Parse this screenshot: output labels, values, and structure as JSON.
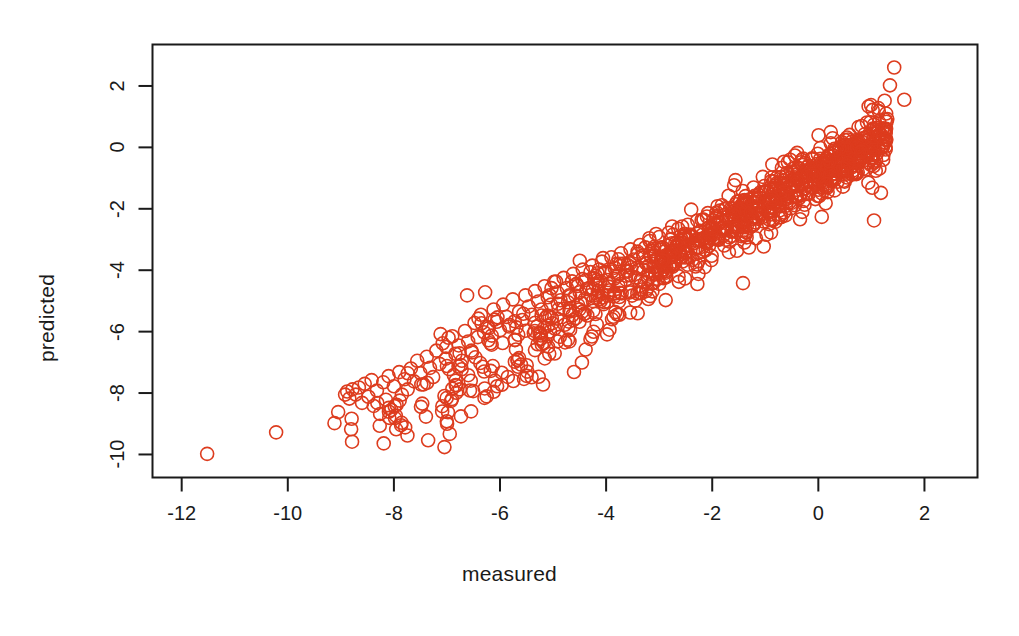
{
  "figure": {
    "background_color": "#ffffff",
    "point_color": "#dd3c1e",
    "axis_color": "#1a1a1a"
  },
  "chart_data": {
    "type": "scatter",
    "title": "",
    "subtitle": "",
    "xlabel": "measured",
    "ylabel": "predicted",
    "xlim": [
      -12.55,
      3.0
    ],
    "ylim": [
      -10.75,
      3.35
    ],
    "xticks": [
      -12,
      -10,
      -8,
      -6,
      -4,
      -2,
      0,
      2
    ],
    "xticklabels": [
      "-12",
      "-10",
      "-8",
      "-6",
      "-4",
      "-2",
      "0",
      "2"
    ],
    "yticks": [
      2,
      0,
      -2,
      -4,
      -6,
      -8,
      -10
    ],
    "yticklabels": [
      "2",
      "0",
      "-2",
      "-4",
      "-6",
      "-8",
      "-10"
    ],
    "grid": false,
    "legend": null,
    "marker": "open-circle",
    "marker_size": 13,
    "marker_stroke_width": 1.6,
    "n_points": 1100,
    "relationship": "strong positive linear, predicted ~ measured",
    "series": [
      {
        "name": "predicted vs measured",
        "color": "#dd3c1e",
        "points": [
          [
            -11.52,
            -9.98
          ],
          [
            -10.22,
            -9.28
          ],
          [
            -9.12,
            -8.98
          ],
          [
            -9.05,
            -8.62
          ],
          [
            -8.92,
            -8.05
          ],
          [
            -8.88,
            -7.95
          ],
          [
            -8.84,
            -8.18
          ],
          [
            -8.78,
            -7.88
          ],
          [
            -8.72,
            -8.05
          ],
          [
            -8.66,
            -7.82
          ],
          [
            -8.6,
            -8.32
          ],
          [
            -8.55,
            -7.7
          ],
          [
            -8.48,
            -8.12
          ],
          [
            -8.42,
            -7.58
          ],
          [
            -8.38,
            -8.42
          ],
          [
            -8.32,
            -7.92
          ],
          [
            -8.26,
            -8.68
          ],
          [
            -8.2,
            -7.65
          ],
          [
            -8.15,
            -8.22
          ],
          [
            -8.1,
            -7.45
          ],
          [
            -8.05,
            -8.55
          ],
          [
            -8.0,
            -7.78
          ],
          [
            -7.95,
            -8.38
          ],
          [
            -7.9,
            -7.32
          ],
          [
            -7.85,
            -8.05
          ],
          [
            -7.8,
            -7.55
          ],
          [
            -7.74,
            -7.88
          ],
          [
            -7.68,
            -7.2
          ],
          [
            -7.62,
            -7.62
          ],
          [
            -7.56,
            -6.95
          ],
          [
            -7.5,
            -7.35
          ],
          [
            -7.44,
            -7.72
          ],
          [
            -7.38,
            -6.82
          ],
          [
            -7.32,
            -7.18
          ],
          [
            -7.26,
            -7.48
          ],
          [
            -7.2,
            -6.62
          ],
          [
            -7.14,
            -7.05
          ],
          [
            -7.08,
            -6.38
          ],
          [
            -7.02,
            -6.88
          ],
          [
            -6.96,
            -7.22
          ],
          [
            -6.9,
            -6.15
          ],
          [
            -6.84,
            -6.72
          ],
          [
            -6.78,
            -6.45
          ],
          [
            -6.72,
            -6.95
          ],
          [
            -6.66,
            -5.98
          ],
          [
            -6.6,
            -6.32
          ],
          [
            -6.54,
            -6.62
          ],
          [
            -6.48,
            -5.72
          ],
          [
            -6.42,
            -6.18
          ],
          [
            -6.36,
            -5.45
          ],
          [
            -6.3,
            -6.02
          ],
          [
            -6.24,
            -5.85
          ],
          [
            -6.18,
            -6.38
          ],
          [
            -6.12,
            -5.28
          ],
          [
            -6.06,
            -5.68
          ],
          [
            -6.0,
            -5.95
          ],
          [
            -5.94,
            -5.12
          ],
          [
            -5.88,
            -5.52
          ],
          [
            -5.82,
            -5.78
          ],
          [
            -5.76,
            -4.95
          ],
          [
            -5.7,
            -6.58
          ],
          [
            -5.64,
            -5.35
          ],
          [
            -5.58,
            -5.62
          ],
          [
            -5.52,
            -4.82
          ],
          [
            -5.46,
            -5.18
          ],
          [
            -5.4,
            -5.45
          ],
          [
            -5.34,
            -4.68
          ],
          [
            -5.28,
            -5.02
          ],
          [
            -5.22,
            -5.28
          ],
          [
            -5.16,
            -4.52
          ],
          [
            -5.1,
            -4.88
          ],
          [
            -5.04,
            -5.12
          ],
          [
            -4.98,
            -4.38
          ],
          [
            -4.92,
            -4.72
          ],
          [
            -4.86,
            -4.98
          ],
          [
            -4.8,
            -4.25
          ],
          [
            -4.74,
            -4.58
          ],
          [
            -4.68,
            -4.85
          ],
          [
            -4.62,
            -4.12
          ],
          [
            -4.56,
            -4.45
          ],
          [
            -4.5,
            -4.72
          ],
          [
            -4.44,
            -3.98
          ],
          [
            -4.38,
            -4.32
          ],
          [
            -4.32,
            -4.58
          ],
          [
            -4.26,
            -3.85
          ],
          [
            -4.2,
            -4.18
          ],
          [
            -4.14,
            -4.45
          ],
          [
            -4.08,
            -3.72
          ],
          [
            -4.02,
            -4.05
          ],
          [
            -3.96,
            -4.32
          ],
          [
            -3.9,
            -3.58
          ],
          [
            -3.84,
            -3.92
          ],
          [
            -3.78,
            -4.18
          ],
          [
            -3.72,
            -3.45
          ],
          [
            -3.66,
            -3.78
          ],
          [
            -3.6,
            -4.05
          ],
          [
            -3.54,
            -3.32
          ],
          [
            -3.48,
            -3.65
          ],
          [
            -3.42,
            -3.92
          ],
          [
            -3.36,
            -3.18
          ],
          [
            -3.3,
            -3.52
          ],
          [
            -3.24,
            -3.78
          ],
          [
            -3.18,
            -3.05
          ],
          [
            -3.12,
            -3.38
          ],
          [
            -3.06,
            -3.65
          ],
          [
            -3.0,
            -2.92
          ],
          [
            -2.94,
            -3.25
          ],
          [
            -2.88,
            -3.52
          ],
          [
            -2.82,
            -2.78
          ],
          [
            -2.76,
            -3.12
          ],
          [
            -2.7,
            -3.38
          ],
          [
            -2.64,
            -2.65
          ],
          [
            -2.58,
            -2.98
          ],
          [
            -2.52,
            -3.25
          ],
          [
            -2.46,
            -2.52
          ],
          [
            -2.4,
            -2.85
          ],
          [
            -2.34,
            -3.12
          ],
          [
            -2.28,
            -2.38
          ],
          [
            -2.22,
            -2.72
          ],
          [
            -2.16,
            -2.98
          ],
          [
            -2.1,
            -2.25
          ],
          [
            -2.04,
            -2.58
          ],
          [
            -1.98,
            -2.85
          ],
          [
            -1.92,
            -2.12
          ],
          [
            -1.86,
            -2.45
          ],
          [
            -1.8,
            -2.72
          ],
          [
            -1.74,
            -1.98
          ],
          [
            -1.68,
            -2.32
          ],
          [
            -1.62,
            -2.58
          ],
          [
            -1.56,
            -1.85
          ],
          [
            -1.5,
            -2.18
          ],
          [
            -1.44,
            -2.45
          ],
          [
            -1.38,
            -1.72
          ],
          [
            -1.32,
            -2.05
          ],
          [
            -1.26,
            -2.32
          ],
          [
            -1.2,
            -1.58
          ],
          [
            -1.14,
            -1.92
          ],
          [
            -1.08,
            -2.18
          ],
          [
            -1.02,
            -1.45
          ],
          [
            -0.96,
            -1.78
          ],
          [
            -0.9,
            -2.05
          ],
          [
            -0.84,
            -1.32
          ],
          [
            -0.78,
            -1.65
          ],
          [
            -0.72,
            -1.92
          ],
          [
            -0.66,
            -1.18
          ],
          [
            -0.6,
            -1.52
          ],
          [
            -0.54,
            -1.78
          ],
          [
            -0.48,
            -1.05
          ],
          [
            -0.42,
            -1.38
          ],
          [
            -0.36,
            -1.65
          ],
          [
            -0.3,
            -0.92
          ],
          [
            -0.24,
            -1.25
          ],
          [
            -0.18,
            -1.52
          ],
          [
            -0.12,
            -0.78
          ],
          [
            -0.06,
            -1.12
          ],
          [
            0.0,
            -1.38
          ],
          [
            0.06,
            -0.65
          ],
          [
            0.12,
            -0.98
          ],
          [
            0.18,
            -1.25
          ],
          [
            0.24,
            -0.52
          ],
          [
            0.3,
            -0.85
          ],
          [
            0.36,
            -1.12
          ],
          [
            0.42,
            -0.38
          ],
          [
            0.48,
            -0.72
          ],
          [
            0.54,
            -0.98
          ],
          [
            0.6,
            -0.25
          ],
          [
            0.66,
            -0.58
          ],
          [
            0.72,
            -0.85
          ],
          [
            0.78,
            -0.12
          ],
          [
            0.84,
            -0.45
          ],
          [
            0.9,
            -0.72
          ],
          [
            0.96,
            0.02
          ],
          [
            1.02,
            -0.32
          ],
          [
            1.08,
            0.45
          ],
          [
            1.14,
            1.18
          ],
          [
            1.2,
            0.58
          ],
          [
            1.25,
            1.52
          ],
          [
            1.3,
            0.92
          ],
          [
            1.35,
            2.02
          ],
          [
            1.43,
            2.6
          ],
          [
            1.62,
            1.55
          ],
          [
            1.18,
            -1.48
          ],
          [
            1.05,
            -2.38
          ],
          [
            -2.28,
            -4.45
          ],
          [
            -1.42,
            -4.42
          ],
          [
            -6.28,
            -4.72
          ],
          [
            -6.62,
            -4.82
          ],
          [
            -5.72,
            -6.98
          ],
          [
            -7.12,
            -6.08
          ]
        ]
      }
    ],
    "note": "Points are synthesized to reproduce the visible density distribution; dense diagonal band from approximately (-9,-8) to (1,0) with ~1100 overlapping open circles."
  }
}
